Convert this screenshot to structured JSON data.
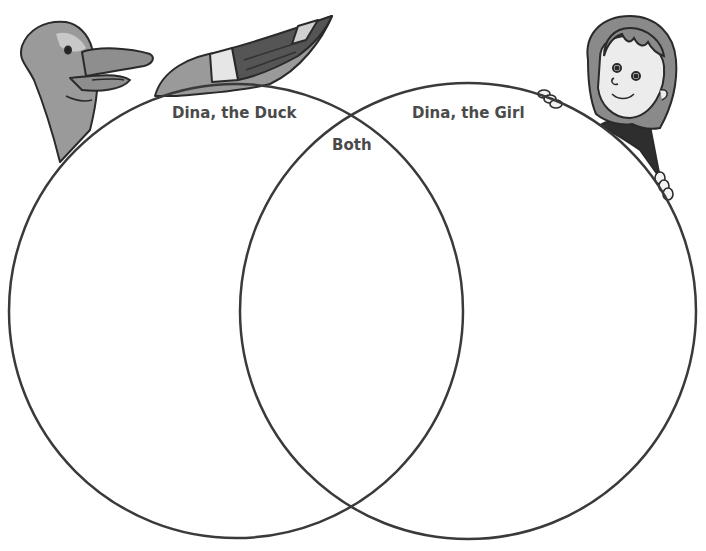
{
  "diagram": {
    "type": "venn",
    "sets": [
      {
        "id": "left",
        "label": "Dina, the Duck"
      },
      {
        "id": "right",
        "label": "Dina, the Girl"
      }
    ],
    "intersection_label": "Both",
    "illustrations": [
      {
        "name": "duck-illustration",
        "description": "duck head and wing peeking over left circle"
      },
      {
        "name": "girl-illustration",
        "description": "girl peeking over right circle holding edge"
      }
    ]
  },
  "colors": {
    "stroke": "#3a3a3a",
    "text": "#4a4a4a",
    "duck_body": "#9a9a9a",
    "wing_dark": "#555555",
    "hair": "#8a8a8a",
    "shirt": "#2e2e2e"
  }
}
